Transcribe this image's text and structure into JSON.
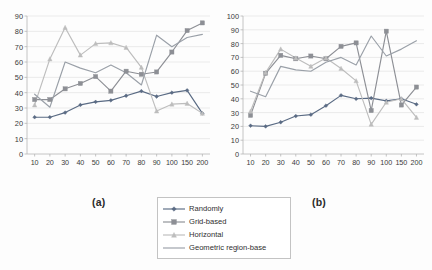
{
  "figure": {
    "background": "#ffffff",
    "panel_a_caption": "(a)",
    "panel_b_caption": "(b)"
  },
  "legend": {
    "position": "bottom-center",
    "items": [
      {
        "label": "Randomly",
        "marker": "diamond",
        "color": "#5a6b84"
      },
      {
        "label": "Grid-based",
        "marker": "square",
        "color": "#8d8f95"
      },
      {
        "label": "Horizontal",
        "marker": "triangle",
        "color": "#bdbdbd"
      },
      {
        "label": "Geometric region-base",
        "marker": "none",
        "color": "#9aa0a8"
      }
    ]
  },
  "chart_data": [
    {
      "type": "line",
      "title": "(a)",
      "xlabel": "",
      "ylabel": "",
      "categories": [
        "10",
        "20",
        "30",
        "40",
        "50",
        "60",
        "70",
        "80",
        "90",
        "100",
        "150",
        "200"
      ],
      "ylim": [
        0,
        90
      ],
      "yticks": [
        0,
        10,
        20,
        30,
        40,
        50,
        60,
        70,
        80,
        90
      ],
      "grid": true,
      "legend_position": "bottom-center",
      "series": [
        {
          "name": "Randomly",
          "marker": "diamond",
          "color": "#5a6b84",
          "values": [
            24,
            24,
            27,
            32,
            34,
            35,
            38,
            41,
            37.5,
            40,
            41.5,
            26.5
          ]
        },
        {
          "name": "Grid-based",
          "marker": "square",
          "color": "#8d8f95",
          "values": [
            35.5,
            35.5,
            42.5,
            46,
            50.5,
            41,
            54,
            52,
            53.5,
            66.5,
            80.5,
            85.5
          ]
        },
        {
          "name": "Horizontal",
          "marker": "triangle",
          "color": "#bdbdbd",
          "values": [
            32,
            62,
            82.5,
            64.5,
            72,
            72.5,
            69.5,
            56.5,
            28,
            32.5,
            33,
            26.5
          ]
        },
        {
          "name": "Geometric region-base",
          "marker": "none",
          "color": "#9aa0a8",
          "values": [
            39,
            30.5,
            60,
            56,
            53,
            58,
            53,
            45,
            77.5,
            70,
            76,
            78
          ]
        }
      ]
    },
    {
      "type": "line",
      "title": "(b)",
      "xlabel": "",
      "ylabel": "",
      "categories": [
        "10",
        "20",
        "30",
        "40",
        "50",
        "60",
        "70",
        "80",
        "90",
        "100",
        "150",
        "200"
      ],
      "ylim": [
        0,
        100
      ],
      "yticks": [
        0,
        10,
        20,
        30,
        40,
        50,
        60,
        70,
        80,
        90,
        100
      ],
      "grid": true,
      "legend_position": "bottom-center",
      "series": [
        {
          "name": "Randomly",
          "marker": "diamond",
          "color": "#5a6b84",
          "values": [
            20.5,
            20,
            23,
            27.5,
            28.5,
            35,
            42.5,
            40,
            40.5,
            38.5,
            40,
            36
          ]
        },
        {
          "name": "Grid-based",
          "marker": "square",
          "color": "#8d8f95",
          "values": [
            28,
            58.5,
            71.5,
            69,
            71,
            69,
            78,
            80.5,
            31.5,
            89,
            35.5,
            48.5
          ]
        },
        {
          "name": "Horizontal",
          "marker": "triangle",
          "color": "#bdbdbd",
          "values": [
            31,
            59,
            76,
            69.5,
            63.5,
            69.5,
            62,
            53,
            21.5,
            37.5,
            40,
            26.5
          ]
        },
        {
          "name": "Geometric region-base",
          "marker": "none",
          "color": "#9aa0a8",
          "values": [
            45.5,
            41.5,
            63.5,
            61,
            60,
            66.5,
            70,
            64.5,
            85.5,
            71,
            76,
            82
          ]
        }
      ]
    }
  ]
}
